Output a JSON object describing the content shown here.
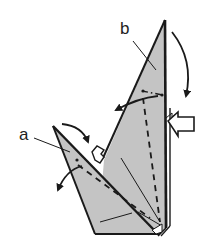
{
  "diagram": {
    "type": "origami-fold-step",
    "labels": {
      "a": "a",
      "b": "b"
    },
    "colors": {
      "paper": "#c4c4c4",
      "line": "#1a1a1a",
      "background": "#ffffff"
    },
    "symbols": [
      {
        "name": "valley-fold-line",
        "style": "dashed"
      },
      {
        "name": "mountain-fold-line",
        "style": "dash-dot"
      },
      {
        "name": "fold-arrow",
        "count": 4
      },
      {
        "name": "push-arrow",
        "style": "hollow"
      },
      {
        "name": "pleat-step",
        "style": "hollow"
      }
    ]
  }
}
